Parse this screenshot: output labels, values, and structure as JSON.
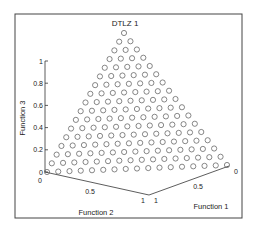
{
  "chart_data": {
    "type": "scatter",
    "projection": "3d",
    "title": "DTLZ 1",
    "xlabel": "Function 1",
    "ylabel": "Function 2",
    "zlabel": "Function 3",
    "x_ticks": [
      "0",
      "0.5",
      "1"
    ],
    "y_ticks": [
      "0",
      "0.5",
      "1"
    ],
    "z_ticks": [
      "0",
      "0.2",
      "0.4",
      "0.6",
      "0.8",
      "1"
    ],
    "xlim": [
      0,
      1
    ],
    "ylim": [
      0,
      1
    ],
    "zlim": [
      0,
      1
    ],
    "grid": false,
    "marker": "open-circle",
    "divisions": 16,
    "point_count": 153
  },
  "render": {
    "frame": {
      "x": 15,
      "y": 14,
      "w": 227,
      "h": 204
    },
    "apex": [
      124,
      33
    ],
    "bottom_left": [
      47,
      172
    ],
    "bottom_right": [
      227,
      165
    ],
    "marker_radius": 2.6,
    "marker_color": "#555555",
    "axis_color": "#333333"
  }
}
